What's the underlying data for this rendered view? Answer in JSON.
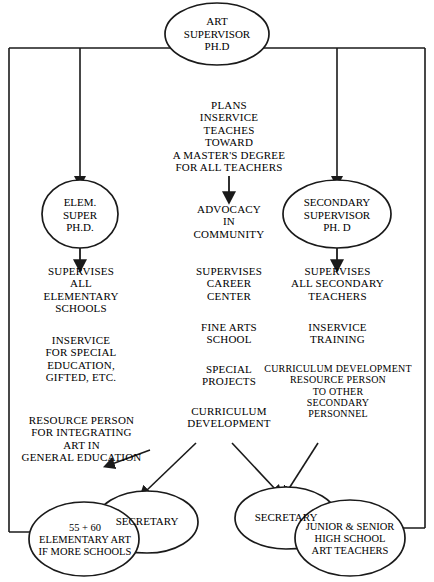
{
  "diagram": {
    "line_color": "#1a1a1a",
    "text_color": "#000000",
    "background": "#ffffff"
  },
  "nodes": {
    "art_supervisor": "ART\nSUPERVISOR\nPH.D",
    "elem_super": "ELEM.\nSUPER\nPH.D.",
    "secondary_supervisor": "SECONDARY\nSUPERVISOR\nPH. D",
    "secretary_left": "SECRETARY",
    "secretary_right": "SECRETARY",
    "elementary_art": "55 + 60\nELEMENTARY ART\nIF MORE SCHOOLS",
    "high_school_art": "JUNIOR & SENIOR\nHIGH SCHOOL\nART TEACHERS"
  },
  "center_column": {
    "plans_block": "PLANS\nINSERVICE\nTEACHES\nTOWARD\nA MASTER'S DEGREE\nFOR ALL TEACHERS",
    "advocacy": "ADVOCACY\nIN\nCOMMUNITY",
    "supervises_career": "SUPERVISES\nCAREER\nCENTER",
    "fine_arts": "FINE ARTS\nSCHOOL",
    "special_projects": "SPECIAL\nPROJECTS",
    "curriculum_development": "CURRICULUM\nDEVELOPMENT"
  },
  "left_column": {
    "supervises_elementary": "SUPERVISES\nALL\nELEMENTARY\nSCHOOLS",
    "inservice_special": "INSERVICE\nFOR SPECIAL\nEDUCATION,\nGIFTED, ETC.",
    "resource_person": "RESOURCE PERSON\nFOR INTEGRATING\nART IN\nGENERAL EDUCATION"
  },
  "right_column": {
    "supervises_secondary": "SUPERVISES\nALL SECONDARY\nTEACHERS",
    "inservice_training": "INSERVICE\nTRAINING",
    "curriculum_resource": "CURRICULUM DEVELOPMENT\nRESOURCE PERSON\nTO OTHER\nSECONDARY\nPERSONNEL"
  }
}
